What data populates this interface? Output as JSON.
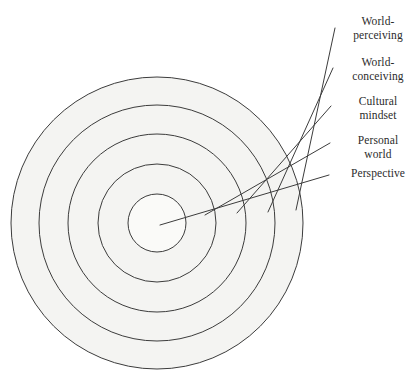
{
  "figure": {
    "background_color": "#ffffff",
    "ring_fill_color": "#f4f4f2",
    "stroke_color": "#3c3c3c",
    "center": {
      "x": 157,
      "y": 223
    }
  },
  "rings": [
    {
      "id": "ring-world-perceiving",
      "label_line1": "World-",
      "label_line2": "perceiving",
      "radius": 146,
      "order": 1
    },
    {
      "id": "ring-world-conceiving",
      "label_line1": "World-",
      "label_line2": "conceiving",
      "radius": 118,
      "order": 2
    },
    {
      "id": "ring-cultural-mindset",
      "label_line1": "Cultural",
      "label_line2": "mindset",
      "radius": 89,
      "order": 3
    },
    {
      "id": "ring-personal-world",
      "label_line1": "Personal",
      "label_line2": "world",
      "radius": 59,
      "order": 4
    },
    {
      "id": "ring-perspective",
      "label_line1": "Perspective",
      "label_line2": "",
      "radius": 29,
      "order": 5
    }
  ],
  "leaders": [
    {
      "id": "leader-world-perceiving",
      "x1": 296,
      "y1": 210,
      "x2": 335,
      "y2": 28
    },
    {
      "id": "leader-world-conceiving",
      "x1": 268,
      "y1": 212,
      "x2": 333,
      "y2": 68
    },
    {
      "id": "leader-cultural-mindset",
      "x1": 237,
      "y1": 213,
      "x2": 331,
      "y2": 106
    },
    {
      "id": "leader-personal-world",
      "x1": 205,
      "y1": 215,
      "x2": 330,
      "y2": 143
    },
    {
      "id": "leader-perspective",
      "x1": 160,
      "y1": 225,
      "x2": 329,
      "y2": 175
    }
  ],
  "labels": [
    {
      "id": "label-world-perceiving",
      "line1": "World-",
      "line2": "perceiving",
      "left": 341,
      "top": 14
    },
    {
      "id": "label-world-conceiving",
      "line1": "World-",
      "line2": "conceiving",
      "left": 341,
      "top": 55
    },
    {
      "id": "label-cultural-mindset",
      "line1": "Cultural",
      "line2": "mindset",
      "left": 341,
      "top": 94
    },
    {
      "id": "label-personal-world",
      "line1": "Personal",
      "line2": "world",
      "left": 341,
      "top": 133
    },
    {
      "id": "label-perspective",
      "line1": "Perspective",
      "line2": "",
      "left": 339,
      "top": 166
    }
  ]
}
